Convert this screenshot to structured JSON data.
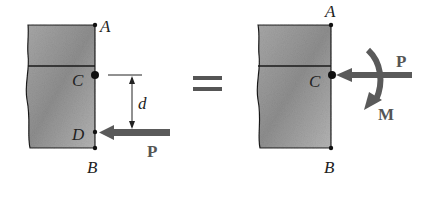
{
  "figure": {
    "colors": {
      "block_fill_light": "#c8c8c8",
      "block_fill_dark": "#8a8a8a",
      "outline": "#1a1a1a",
      "arrow": "#5a5a5a",
      "label": "#222222"
    },
    "left": {
      "labels": {
        "A": "A",
        "C": "C",
        "D": "D",
        "B": "B",
        "d": "d",
        "P": "P"
      }
    },
    "equals": "=",
    "right": {
      "labels": {
        "A": "A",
        "C": "C",
        "B": "B",
        "P": "P",
        "M": "M"
      }
    }
  }
}
